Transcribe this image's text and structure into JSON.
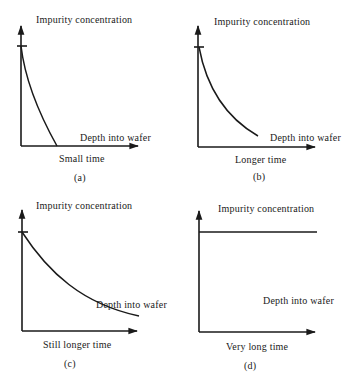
{
  "figure": {
    "panels": [
      {
        "id": "a",
        "tag": "(a)",
        "y_axis_label": "Impurity concentration",
        "x_axis_label": "Depth into wafer",
        "caption": "Small time",
        "profile": "steep decay reaching zero at shallow depth"
      },
      {
        "id": "b",
        "tag": "(b)",
        "y_axis_label": "Impurity concentration",
        "x_axis_label": "Depth into wafer",
        "caption": "Longer time",
        "profile": "moderate exponential-like decay"
      },
      {
        "id": "c",
        "tag": "(c)",
        "y_axis_label": "Impurity concentration",
        "x_axis_label": "Depth into wafer",
        "caption": "Still longer time",
        "profile": "gradual decay across the full depth"
      },
      {
        "id": "d",
        "tag": "(d)",
        "y_axis_label": "Impurity concentration",
        "x_axis_label": "Depth into wafer",
        "caption": "Very long time",
        "profile": "uniform (flat) concentration"
      }
    ]
  }
}
